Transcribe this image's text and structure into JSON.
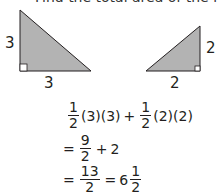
{
  "clipped_heading": "Find the total area of the figures given by",
  "figures": {
    "left_triangle": {
      "height_label": "3",
      "base_label": "3"
    },
    "right_triangle": {
      "height_label": "2",
      "base_label": "2"
    },
    "fill_color": "#b3b3b3",
    "stroke_color": "#231f20"
  },
  "equations": {
    "line1": {
      "frac1": {
        "num": "1",
        "den": "2"
      },
      "term1": "(3)(3)",
      "op": "+",
      "frac2": {
        "num": "1",
        "den": "2"
      },
      "term2": "(2)(2)"
    },
    "line2": {
      "eq": "=",
      "frac": {
        "num": "9",
        "den": "2"
      },
      "op": "+",
      "term": "2"
    },
    "line3": {
      "eq1": "=",
      "frac": {
        "num": "13",
        "den": "2"
      },
      "eq2": "=",
      "whole": "6",
      "mixed_frac": {
        "num": "1",
        "den": "2"
      }
    }
  }
}
